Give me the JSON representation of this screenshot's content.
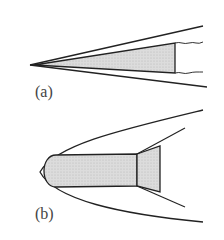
{
  "diagram": {
    "panels": [
      {
        "label": "(a)",
        "description": "Sharp cone with attached oblique shock wave",
        "body_fill": "#d9d9d9"
      },
      {
        "label": "(b)",
        "description": "Blunt-nosed body with flared base and detached bow shock",
        "body_fill": "#d9d9d9"
      }
    ],
    "colors": {
      "stroke": "#222222",
      "fill": "#d9d9d9",
      "background": "#ffffff"
    }
  }
}
